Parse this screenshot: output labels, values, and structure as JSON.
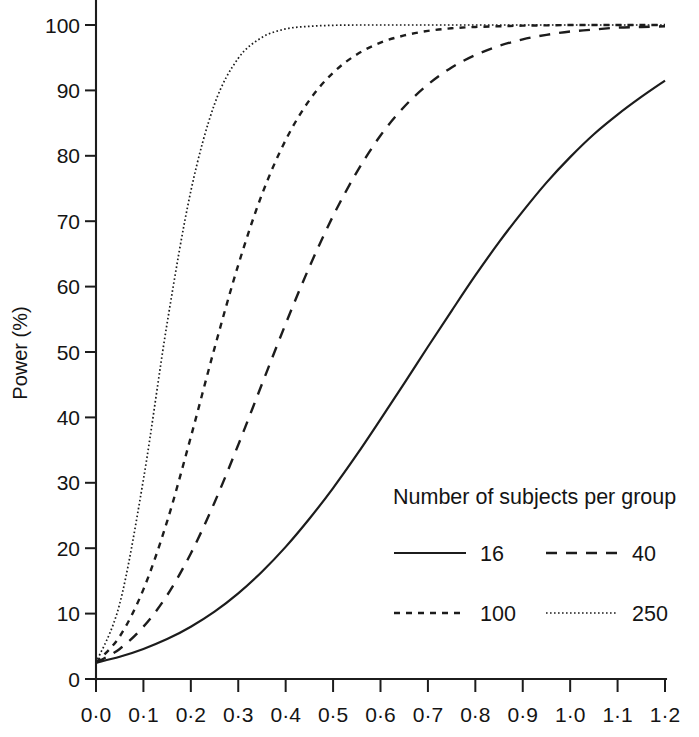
{
  "chart_data": {
    "type": "line",
    "title": "",
    "xlabel": "",
    "ylabel": "Power (%)",
    "xlim": [
      0.0,
      1.2
    ],
    "ylim": [
      0,
      100
    ],
    "grid": false,
    "legend_position": "inside-lower-right",
    "legend_title": "Number of subjects per group",
    "x_tick_labels": [
      "0·0",
      "0·1",
      "0·2",
      "0·3",
      "0·4",
      "0·5",
      "0·6",
      "0·7",
      "0·8",
      "0·9",
      "1·0",
      "1·1",
      "1·2"
    ],
    "x_tick_values": [
      0.0,
      0.1,
      0.2,
      0.3,
      0.4,
      0.5,
      0.6,
      0.7,
      0.8,
      0.9,
      1.0,
      1.1,
      1.2
    ],
    "y_tick_labels": [
      "0",
      "10",
      "20",
      "30",
      "40",
      "50",
      "60",
      "70",
      "80",
      "90",
      "100"
    ],
    "y_tick_values": [
      0,
      10,
      20,
      30,
      40,
      50,
      60,
      70,
      80,
      90,
      100
    ],
    "x": [
      0.0,
      0.05,
      0.1,
      0.15,
      0.2,
      0.25,
      0.3,
      0.35,
      0.4,
      0.45,
      0.5,
      0.55,
      0.6,
      0.65,
      0.7,
      0.75,
      0.8,
      0.85,
      0.9,
      0.95,
      1.0,
      1.05,
      1.1,
      1.15,
      1.2
    ],
    "series": [
      {
        "name": "16",
        "label": "16",
        "style": "solid",
        "color": "#1c1c1c",
        "values": [
          2.5,
          3.4,
          4.6,
          6.1,
          8.0,
          10.3,
          13.1,
          16.4,
          20.2,
          24.5,
          29.2,
          34.3,
          39.7,
          45.2,
          50.8,
          56.3,
          61.7,
          66.8,
          71.5,
          75.9,
          79.8,
          83.3,
          86.3,
          89.0,
          91.5
        ]
      },
      {
        "name": "40",
        "label": "40",
        "style": "dashed",
        "color": "#1c1c1c",
        "values": [
          2.5,
          4.6,
          8.0,
          12.8,
          19.2,
          27.0,
          35.8,
          45.1,
          54.3,
          63.0,
          70.8,
          77.5,
          83.1,
          87.5,
          90.9,
          93.5,
          95.4,
          96.8,
          97.8,
          98.5,
          99.0,
          99.3,
          99.6,
          99.7,
          99.8
        ]
      },
      {
        "name": "100",
        "label": "100",
        "style": "short-dashed",
        "color": "#1c1c1c",
        "values": [
          2.5,
          6.5,
          13.7,
          24.1,
          37.0,
          50.6,
          63.3,
          74.1,
          82.4,
          88.5,
          92.7,
          95.5,
          97.3,
          98.4,
          99.1,
          99.5,
          99.7,
          99.8,
          99.9,
          99.95,
          100.0,
          100.0,
          100.0,
          100.0,
          100.0
        ]
      },
      {
        "name": "250",
        "label": "250",
        "style": "dotted",
        "color": "#1c1c1c",
        "values": [
          2.5,
          11.5,
          30.5,
          54.4,
          74.6,
          87.9,
          94.9,
          98.1,
          99.4,
          99.8,
          99.95,
          100.0,
          100.0,
          100.0,
          100.0,
          100.0,
          100.0,
          100.0,
          100.0,
          100.0,
          100.0,
          100.0,
          100.0,
          100.0,
          100.0
        ]
      }
    ]
  }
}
